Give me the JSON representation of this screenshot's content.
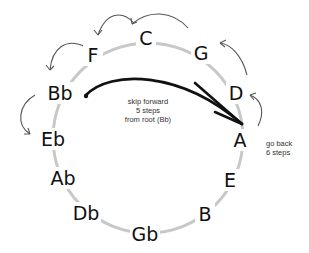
{
  "diagram": {
    "type": "circle-of-fifths",
    "notes": [
      {
        "label": "C",
        "x": 146,
        "y": 38
      },
      {
        "label": "G",
        "x": 201,
        "y": 53
      },
      {
        "label": "D",
        "x": 236,
        "y": 93
      },
      {
        "label": "A",
        "x": 240,
        "y": 140
      },
      {
        "label": "E",
        "x": 230,
        "y": 180
      },
      {
        "label": "B",
        "x": 205,
        "y": 214
      },
      {
        "label": "Gb",
        "x": 145,
        "y": 234
      },
      {
        "label": "Db",
        "x": 86,
        "y": 213
      },
      {
        "label": "Ab",
        "x": 63,
        "y": 178
      },
      {
        "label": "Eb",
        "x": 53,
        "y": 139
      },
      {
        "label": "Bb",
        "x": 60,
        "y": 93
      },
      {
        "label": "F",
        "x": 93,
        "y": 55
      }
    ],
    "annotations": {
      "skip_forward": [
        "skip forward",
        "5 steps",
        "from root (Bb)"
      ],
      "go_back": [
        "go back",
        "6 steps"
      ]
    },
    "colors": {
      "ring": "#c8c8c8",
      "text": "#111111",
      "arrow": "#111111",
      "hop_arrow": "#555555"
    }
  }
}
